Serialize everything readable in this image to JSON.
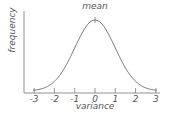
{
  "chart_data": {
    "type": "line",
    "title": "",
    "xlabel": "variance",
    "ylabel": "frequency",
    "x_ticks": [
      "-3",
      "-2",
      "-1",
      "0",
      "1",
      "2",
      "3"
    ],
    "xlim": [
      -3.5,
      3.3
    ],
    "annotations": [
      {
        "text": "mean",
        "x": 0
      }
    ],
    "series": [
      {
        "name": "normal distribution",
        "x": [
          -3,
          -2.5,
          -2,
          -1.5,
          -1,
          -0.5,
          0,
          0.5,
          1,
          1.5,
          2,
          2.5,
          3
        ],
        "y": [
          0.011,
          0.044,
          0.135,
          0.325,
          0.607,
          0.882,
          1.0,
          0.882,
          0.607,
          0.325,
          0.135,
          0.044,
          0.011
        ]
      }
    ],
    "grid": false,
    "legend": "none"
  },
  "labels": {
    "x": "variance",
    "y": "frequency",
    "mean": "mean"
  },
  "ticks": [
    "-3",
    "-2",
    "-1",
    "0",
    "1",
    "2",
    "3"
  ]
}
